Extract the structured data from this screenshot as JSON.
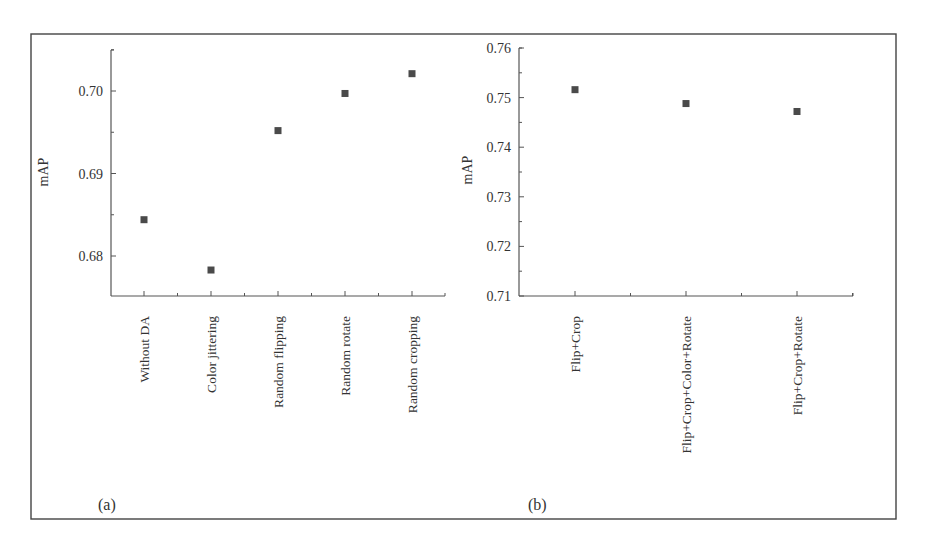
{
  "figure": {
    "frame": {
      "left": 31,
      "top": 34,
      "right": 896,
      "bottom": 519
    },
    "colors": {
      "marker": "#4a4a4a",
      "axis": "#555555",
      "frame": "#444444",
      "text": "#333333"
    }
  },
  "chart_data": [
    {
      "panel_label": "(a)",
      "type": "scatter",
      "title": "",
      "xlabel": "",
      "ylabel": "mAP",
      "categories": [
        "Without DA",
        "Color jittering",
        "Random flipping",
        "Random rotate",
        "Random cropping"
      ],
      "values": [
        0.6844,
        0.6783,
        0.6952,
        0.6997,
        0.7021
      ],
      "ylim": [
        0.6755,
        0.705
      ],
      "yticks": [
        0.68,
        0.69,
        0.7
      ],
      "ytick_labels": [
        "0.68",
        "0.69",
        "0.70"
      ],
      "minor_ticks": true,
      "grid": false,
      "legend": null,
      "marker": "square",
      "layout": {
        "x0": 111,
        "x1": 445,
        "yTop": 50,
        "yBottom": 296,
        "catX": [
          144,
          211,
          278,
          345,
          412
        ],
        "pxPerUnit": 8250,
        "refVal": 0.7,
        "refY": 91,
        "titleX": 48,
        "titleY": 172,
        "labelX": 98,
        "labelY": 510
      }
    },
    {
      "panel_label": "(b)",
      "type": "scatter",
      "title": "",
      "xlabel": "",
      "ylabel": "mAP",
      "categories": [
        "Flip+Crop",
        "Flip+Crop+Color+Rotate",
        "Flip+Crop+Rotate"
      ],
      "values": [
        0.7516,
        0.7488,
        0.7472
      ],
      "ylim": [
        0.71,
        0.76
      ],
      "yticks": [
        0.71,
        0.72,
        0.73,
        0.74,
        0.75,
        0.76
      ],
      "ytick_labels": [
        "0.71",
        "0.72",
        "0.73",
        "0.74",
        "0.75",
        "0.76"
      ],
      "minor_ticks": true,
      "grid": false,
      "legend": null,
      "marker": "square",
      "layout": {
        "x0": 519,
        "x1": 853,
        "yTop": 48,
        "yBottom": 296,
        "catX": [
          575,
          686,
          797
        ],
        "pxPerUnit": 4960,
        "refVal": 0.71,
        "refY": 296,
        "titleX": 472,
        "titleY": 170,
        "labelX": 528,
        "labelY": 510
      }
    }
  ]
}
